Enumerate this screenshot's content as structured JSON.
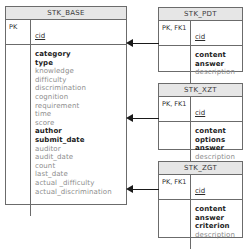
{
  "diagram": {
    "type": "entity-relationship-diagram",
    "entities": [
      {
        "id": "stk_base",
        "name": "STK_BASE",
        "key_label": "PK",
        "key_field": "cid",
        "attributes": [
          {
            "name": "category",
            "required": true
          },
          {
            "name": "type",
            "required": true
          },
          {
            "name": "knowledge",
            "required": false
          },
          {
            "name": "difficulty",
            "required": false
          },
          {
            "name": "discrimination",
            "required": false
          },
          {
            "name": "cognition",
            "required": false
          },
          {
            "name": "requirement",
            "required": false
          },
          {
            "name": "time",
            "required": false
          },
          {
            "name": "score",
            "required": false
          },
          {
            "name": "author",
            "required": true
          },
          {
            "name": "submit_date",
            "required": true
          },
          {
            "name": "auditor",
            "required": false
          },
          {
            "name": "audit_date",
            "required": false
          },
          {
            "name": "count",
            "required": false
          },
          {
            "name": "last_date",
            "required": false
          },
          {
            "name": "actual _difficulty",
            "required": false
          },
          {
            "name": "actual_discrimination",
            "required": false
          }
        ]
      },
      {
        "id": "stk_pdt",
        "name": "STK_PDT",
        "key_label": "PK, FK1",
        "key_field": "cid",
        "attributes": [
          {
            "name": "content",
            "required": true
          },
          {
            "name": "answer",
            "required": true
          },
          {
            "name": "description",
            "required": false
          }
        ]
      },
      {
        "id": "stk_xzt",
        "name": "STK_XZT",
        "key_label": "PK, FK1",
        "key_field": "cid",
        "attributes": [
          {
            "name": "content",
            "required": true
          },
          {
            "name": "options",
            "required": true
          },
          {
            "name": "answer",
            "required": true
          },
          {
            "name": "description",
            "required": false
          }
        ]
      },
      {
        "id": "stk_zgt",
        "name": "STK_ZGT",
        "key_label": "PK, FK1",
        "key_field": "cid",
        "attributes": [
          {
            "name": "content",
            "required": true
          },
          {
            "name": "answer",
            "required": true
          },
          {
            "name": "criterion",
            "required": true
          },
          {
            "name": "description",
            "required": false
          }
        ]
      }
    ],
    "relationships": [
      {
        "id": "rel_pdt",
        "from": "stk_pdt",
        "to": "stk_base",
        "arrow": "left"
      },
      {
        "id": "rel_xzt",
        "from": "stk_xzt",
        "to": "stk_base",
        "arrow": "left"
      },
      {
        "id": "rel_zgt",
        "from": "stk_zgt",
        "to": "stk_base",
        "arrow": "left"
      }
    ],
    "colors": {
      "border": "#6b6b6b",
      "header_fill": "#e6e6e6",
      "required_text": "#1c1c1c",
      "optional_text": "#8d8d8d",
      "connector": "#1a1a1a",
      "background": "#ffffff"
    }
  }
}
